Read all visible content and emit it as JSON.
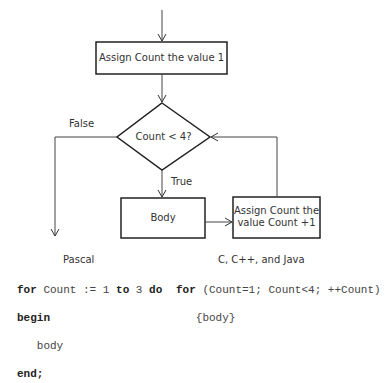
{
  "flowchart": {
    "init_box": "Assign Count the value 1",
    "condition": "Count < 4?",
    "false_label": "False",
    "true_label": "True",
    "body_box": "Body",
    "increment_box_line1": "Assign Count the",
    "increment_box_line2": "value Count +1"
  },
  "code": {
    "pascal": {
      "heading": "Pascal",
      "line1_kw1": "for",
      "line1_mid1": " Count := 1 ",
      "line1_kw2": "to",
      "line1_mid2": " 3 ",
      "line1_kw3": "do",
      "line2": "begin",
      "line3": "   body",
      "line4": "end;"
    },
    "c_family": {
      "heading": "C, C++, and Java",
      "line1_kw": "for",
      "line1_rest": " (Count=1; Count<4; ++Count)",
      "line2": "   {body}"
    }
  }
}
